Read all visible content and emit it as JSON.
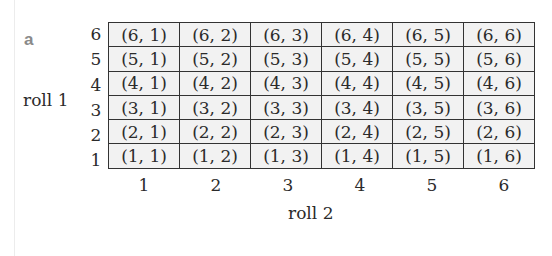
{
  "panel_label": "a",
  "y_axis": {
    "title": "roll 1",
    "ticks": [
      "6",
      "5",
      "4",
      "3",
      "2",
      "1"
    ]
  },
  "x_axis": {
    "title": "roll 2",
    "ticks": [
      "1",
      "2",
      "3",
      "4",
      "5",
      "6"
    ]
  },
  "grid": {
    "rows": [
      [
        "(6, 1)",
        "(6, 2)",
        "(6, 3)",
        "(6, 4)",
        "(6, 5)",
        "(6, 6)"
      ],
      [
        "(5, 1)",
        "(5, 2)",
        "(5, 3)",
        "(5, 4)",
        "(5, 5)",
        "(5, 6)"
      ],
      [
        "(4, 1)",
        "(4, 2)",
        "(4, 3)",
        "(4, 4)",
        "(4, 5)",
        "(4, 6)"
      ],
      [
        "(3, 1)",
        "(3, 2)",
        "(3, 3)",
        "(3, 4)",
        "(3, 5)",
        "(3, 6)"
      ],
      [
        "(2, 1)",
        "(2, 2)",
        "(2, 3)",
        "(2, 4)",
        "(2, 5)",
        "(2, 6)"
      ],
      [
        "(1, 1)",
        "(1, 2)",
        "(1, 3)",
        "(1, 4)",
        "(1, 5)",
        "(1, 6)"
      ]
    ]
  },
  "colors": {
    "cell_fill": "#f2f2f2",
    "grid_line": "#333333",
    "label_gray": "#8a8a8a"
  }
}
